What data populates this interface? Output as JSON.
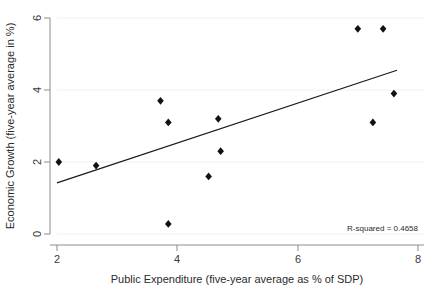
{
  "chart_data": {
    "type": "scatter",
    "title": "",
    "xlabel": "Public Expenditure (five-year average as % of SDP)",
    "ylabel": "Economic Growth (five-year average in %)",
    "xlim": [
      2,
      8
    ],
    "ylim": [
      0,
      6
    ],
    "xticks": [
      2,
      4,
      6,
      8
    ],
    "yticks": [
      0,
      2,
      4,
      6
    ],
    "xtick_labels": [
      "2",
      "4",
      "6",
      "8"
    ],
    "ytick_labels": [
      "0",
      "2",
      "4",
      "6"
    ],
    "grid": true,
    "legend": "none",
    "marker_style": "filled-diamond",
    "marker_color": "#111111",
    "points": [
      {
        "x": 2.03,
        "y": 2.0
      },
      {
        "x": 2.65,
        "y": 1.9
      },
      {
        "x": 3.72,
        "y": 3.7
      },
      {
        "x": 3.85,
        "y": 3.1
      },
      {
        "x": 3.85,
        "y": 0.28
      },
      {
        "x": 4.52,
        "y": 1.6
      },
      {
        "x": 4.68,
        "y": 3.2
      },
      {
        "x": 4.72,
        "y": 2.3
      },
      {
        "x": 7.0,
        "y": 5.7
      },
      {
        "x": 7.25,
        "y": 3.1
      },
      {
        "x": 7.42,
        "y": 5.7
      },
      {
        "x": 7.6,
        "y": 3.9
      }
    ],
    "fit_line": {
      "color": "#1a1a1a",
      "x_start": 2.0,
      "y_start": 1.42,
      "x_end": 7.65,
      "y_end": 4.55
    },
    "annotations": [
      {
        "text": "R-squared = 0.4658",
        "x": 7.55,
        "y": 0.23,
        "align": "right"
      }
    ]
  }
}
